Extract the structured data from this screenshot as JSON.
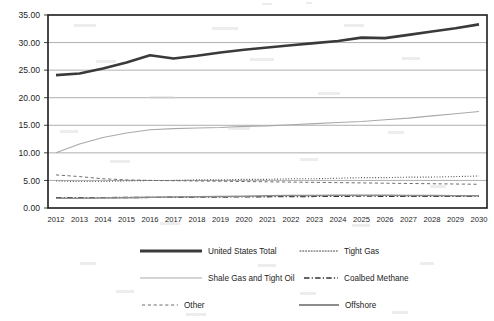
{
  "chart_data": {
    "type": "line",
    "title": "",
    "subtitle": "",
    "xlabel": "",
    "ylabel": "",
    "grid": true,
    "legend_position": "bottom",
    "legend_columns": 2,
    "xlim": [
      2012,
      2030
    ],
    "ylim": [
      0.0,
      35.0
    ],
    "ytick_step": 5.0,
    "ytick_labels": [
      "0.00",
      "5.00",
      "10.00",
      "15.00",
      "20.00",
      "25.00",
      "30.00",
      "35.00"
    ],
    "ytick_values": [
      0.0,
      5.0,
      10.0,
      15.0,
      20.0,
      25.0,
      30.0,
      35.0
    ],
    "categories": [
      "2012",
      "2013",
      "2014",
      "2015",
      "2016",
      "2017",
      "2018",
      "2019",
      "2020",
      "2021",
      "2022",
      "2023",
      "2024",
      "2025",
      "2026",
      "2027",
      "2028",
      "2029",
      "2030"
    ],
    "x": [
      2012,
      2013,
      2014,
      2015,
      2016,
      2017,
      2018,
      2019,
      2020,
      2021,
      2022,
      2023,
      2024,
      2025,
      2026,
      2027,
      2028,
      2029,
      2030
    ],
    "series": [
      {
        "name": "United States Total",
        "style": "solid-thick",
        "color": "#3a3a3a",
        "width": 2.6,
        "values": [
          24.1,
          24.4,
          25.3,
          26.4,
          27.7,
          27.1,
          27.6,
          28.2,
          28.7,
          29.1,
          29.5,
          29.9,
          30.3,
          30.9,
          30.8,
          31.4,
          32.0,
          32.6,
          33.3
        ]
      },
      {
        "name": "Tight Gas",
        "style": "dotted",
        "color": "#424242",
        "width": 1.1,
        "values": [
          4.9,
          4.8,
          4.8,
          4.9,
          5.0,
          5.0,
          5.1,
          5.1,
          5.2,
          5.2,
          5.3,
          5.3,
          5.4,
          5.5,
          5.5,
          5.6,
          5.6,
          5.7,
          5.8
        ]
      },
      {
        "name": "Shale Gas and Tight Oil",
        "style": "solid-thin",
        "color": "#a9a9a9",
        "width": 1.1,
        "values": [
          10.0,
          11.6,
          12.8,
          13.6,
          14.2,
          14.4,
          14.5,
          14.6,
          14.8,
          14.9,
          15.1,
          15.3,
          15.5,
          15.7,
          16.0,
          16.3,
          16.7,
          17.1,
          17.5
        ]
      },
      {
        "name": "Coalbed Methane",
        "style": "dash-dot",
        "color": "#333333",
        "width": 1.4,
        "values": [
          1.85,
          1.85,
          1.88,
          1.9,
          1.92,
          1.95,
          1.97,
          2.0,
          2.02,
          2.05,
          2.08,
          2.1,
          2.13,
          2.15,
          2.14,
          2.13,
          2.12,
          2.11,
          2.1
        ]
      },
      {
        "name": "Other",
        "style": "dashed",
        "color": "#6e6e6e",
        "width": 1.0,
        "values": [
          6.0,
          5.7,
          5.3,
          5.1,
          5.0,
          4.95,
          4.9,
          4.85,
          4.8,
          4.75,
          4.7,
          4.65,
          4.6,
          4.55,
          4.5,
          4.45,
          4.4,
          4.35,
          4.3
        ]
      },
      {
        "name": "Offshore",
        "style": "solid-medium",
        "color": "#8c8c8c",
        "width": 1.5,
        "values": [
          1.75,
          1.78,
          1.82,
          1.88,
          1.95,
          2.0,
          2.05,
          2.1,
          2.15,
          2.2,
          2.25,
          2.28,
          2.3,
          2.32,
          2.3,
          2.28,
          2.26,
          2.24,
          2.22
        ]
      }
    ],
    "legend": [
      {
        "label": "United States Total",
        "style": "solid-thick",
        "color": "#3a3a3a"
      },
      {
        "label": "Tight Gas",
        "style": "dotted",
        "color": "#424242"
      },
      {
        "label": "Shale Gas and Tight Oil",
        "style": "solid-thin",
        "color": "#a9a9a9"
      },
      {
        "label": "Coalbed Methane",
        "style": "dash-dot",
        "color": "#333333"
      },
      {
        "label": "Other",
        "style": "dashed",
        "color": "#6e6e6e"
      },
      {
        "label": "Offshore",
        "style": "solid-medium",
        "color": "#8c8c8c"
      }
    ]
  }
}
